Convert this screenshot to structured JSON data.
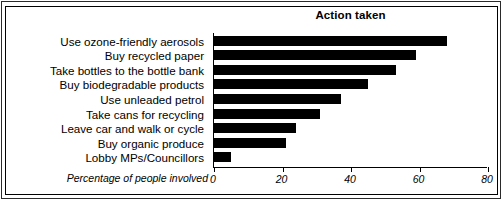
{
  "chart_data": {
    "type": "bar",
    "orientation": "horizontal",
    "title": "Action taken",
    "xlabel": "Percentage of people involved",
    "ylabel": "",
    "xlim": [
      0,
      80
    ],
    "xticks": [
      0,
      20,
      40,
      60,
      80
    ],
    "grid": false,
    "legend": null,
    "categories": [
      "Use ozone-friendly aerosols",
      "Buy recycled paper",
      "Take bottles to the bottle bank",
      "Buy biodegradable products",
      "Use unleaded petrol",
      "Take cans for recycling",
      "Leave car and walk or cycle",
      "Buy organic produce",
      "Lobby MPs/Councillors"
    ],
    "values": [
      68,
      59,
      53,
      45,
      37,
      31,
      24,
      21,
      5
    ],
    "bar_color": "#000000"
  }
}
